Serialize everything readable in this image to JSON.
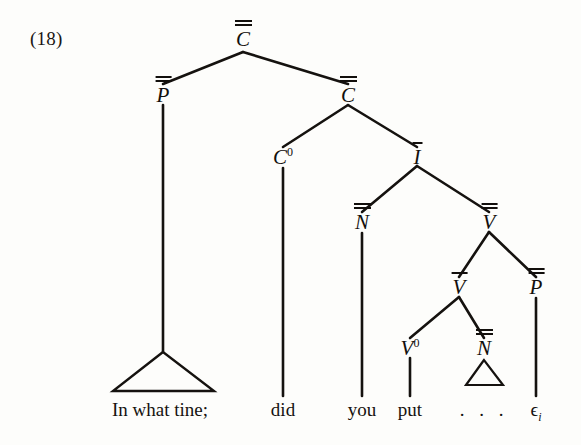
{
  "figure": {
    "example_number": "(18)",
    "type": "x-bar-syntax-tree",
    "ink_color": "#120f0c",
    "background_color": "#fdfdfb"
  },
  "nodes": {
    "cp": {
      "label": "C",
      "bars": 2,
      "name": "node-c-double-bar"
    },
    "pp_spec": {
      "label": "P",
      "bars": 2,
      "name": "node-p-double-bar-specifier"
    },
    "cbar": {
      "label": "C",
      "bars": 2,
      "name": "node-c-bar"
    },
    "c0": {
      "label": "C",
      "bars": 0,
      "superscript": "0",
      "name": "node-c-zero"
    },
    "ibar": {
      "label": "I",
      "bars": 1,
      "name": "node-i-bar"
    },
    "np_subj": {
      "label": "N",
      "bars": 2,
      "name": "node-n-double-bar-subject"
    },
    "vbar_hi": {
      "label": "V",
      "bars": 2,
      "name": "node-v-bar-upper"
    },
    "vbar_lo": {
      "label": "V",
      "bars": 1,
      "name": "node-v-bar-lower"
    },
    "pp_obj": {
      "label": "P",
      "bars": 2,
      "name": "node-p-double-bar-complement"
    },
    "v0": {
      "label": "V",
      "bars": 0,
      "superscript": "0",
      "name": "node-v-zero"
    },
    "np_obj": {
      "label": "N",
      "bars": 2,
      "name": "node-n-double-bar-object"
    }
  },
  "terminals": {
    "phrase_fronted": "In what tine;",
    "aux": "did",
    "subject": "you",
    "verb": "put",
    "object_ellipsis": ". . .",
    "trace": "ϵ",
    "trace_index": "i"
  }
}
